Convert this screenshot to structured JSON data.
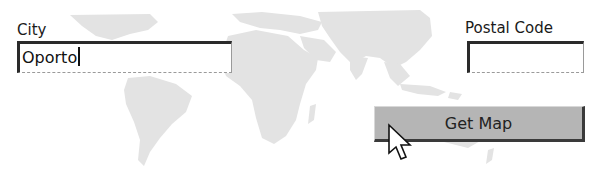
{
  "form": {
    "city": {
      "label": "City",
      "value": "Oporto"
    },
    "postal_code": {
      "label": "Postal Code",
      "value": ""
    },
    "get_map_button": {
      "label": "Get Map"
    }
  },
  "colors": {
    "map_land": "#e2e2e2",
    "button_face": "#b5b5b5",
    "input_border_dark": "#2a2a2a"
  },
  "icons": {
    "background": "world-map",
    "pointer": "mouse-pointer-arrow"
  }
}
